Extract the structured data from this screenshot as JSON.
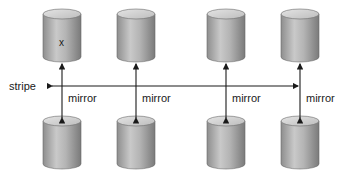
{
  "diagram": {
    "type": "RAID 1+0 (mirrored stripe)",
    "stripe_label": "stripe",
    "mirror_label": "mirror",
    "data_marker": "x",
    "columns": [
      {
        "primary": "disk-1",
        "mirror": "disk-1-mirror",
        "marker": "x"
      },
      {
        "primary": "disk-2",
        "mirror": "disk-2-mirror"
      },
      {
        "primary": "disk-3",
        "mirror": "disk-3-mirror"
      },
      {
        "primary": "disk-4",
        "mirror": "disk-4-mirror"
      }
    ],
    "labels": {
      "stripe": "stripe",
      "mirrors": [
        "mirror",
        "mirror",
        "mirror",
        "mirror"
      ],
      "marker": "x"
    }
  }
}
